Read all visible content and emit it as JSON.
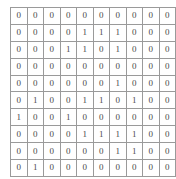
{
  "figure": {
    "type": "binary-matrix-grid",
    "rows": 10,
    "cols": 10,
    "grid_line_color": "#9a9a9a",
    "background_color": "#ffffff",
    "digit_color": "#4a4a4a"
  },
  "chart_data": {
    "type": "table",
    "title": "",
    "xlabel": "",
    "ylabel": "",
    "grid": true,
    "rows": 10,
    "cols": 10,
    "values": [
      [
        0,
        0,
        0,
        0,
        0,
        0,
        0,
        0,
        0,
        0
      ],
      [
        0,
        0,
        0,
        0,
        1,
        1,
        1,
        0,
        0,
        0
      ],
      [
        0,
        0,
        0,
        1,
        1,
        0,
        1,
        0,
        0,
        0
      ],
      [
        0,
        0,
        0,
        0,
        0,
        0,
        0,
        0,
        0,
        0
      ],
      [
        0,
        0,
        0,
        0,
        0,
        0,
        1,
        0,
        0,
        0
      ],
      [
        0,
        1,
        0,
        0,
        1,
        1,
        0,
        1,
        0,
        0
      ],
      [
        1,
        0,
        0,
        1,
        0,
        0,
        0,
        0,
        0,
        0
      ],
      [
        0,
        0,
        0,
        0,
        1,
        1,
        1,
        1,
        0,
        0
      ],
      [
        0,
        0,
        0,
        0,
        0,
        0,
        1,
        1,
        0,
        0
      ],
      [
        0,
        1,
        0,
        0,
        0,
        0,
        0,
        0,
        0,
        0
      ]
    ]
  }
}
